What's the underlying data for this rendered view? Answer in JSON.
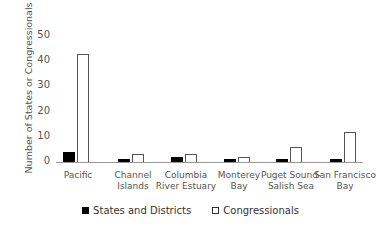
{
  "chart_data": {
    "type": "bar",
    "title": "",
    "xlabel": "",
    "ylabel": "Number of States or Congressionals",
    "ylim": [
      0,
      50
    ],
    "yticks": [
      0,
      10,
      20,
      30,
      40,
      50
    ],
    "categories": [
      "Pacific",
      "Channel Islands",
      "Columbia River Estuary",
      "Monterey Bay",
      "Puget Sound-Salish Sea",
      "San Francisco Bay"
    ],
    "category_lines": [
      [
        "Pacific"
      ],
      [
        "Channel",
        "Islands"
      ],
      [
        "Columbia",
        "River Estuary"
      ],
      [
        "Monterey",
        "Bay"
      ],
      [
        "Puget Sound-",
        "Salish Sea"
      ],
      [
        "San Francisco",
        "Bay"
      ]
    ],
    "series": [
      {
        "name": "States and Districts",
        "color": "#000000",
        "values": [
          4,
          1,
          2,
          1,
          1,
          1
        ]
      },
      {
        "name": "Congressionals",
        "color": "#ffffff",
        "values": [
          43,
          3,
          3,
          2,
          6,
          12
        ]
      }
    ],
    "legend_position": "bottom",
    "grid": false
  }
}
